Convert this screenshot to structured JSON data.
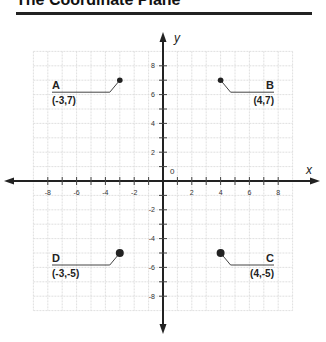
{
  "title": "The Coordinate Plane",
  "axes": {
    "x_label": "x",
    "y_label": "y",
    "origin_label": "0"
  },
  "chart_data": {
    "type": "scatter",
    "title": "The Coordinate Plane",
    "xlabel": "x",
    "ylabel": "y",
    "xlim": [
      -9,
      9
    ],
    "ylim": [
      -9,
      9
    ],
    "grid": true,
    "x_ticks": [
      "-8",
      "-6",
      "-4",
      "-2",
      "2",
      "4",
      "6",
      "8"
    ],
    "y_ticks": [
      "8",
      "6",
      "4",
      "2",
      "-2",
      "-4",
      "-6",
      "-8"
    ],
    "points": [
      {
        "name": "A",
        "label": "(-3,7)",
        "x": -3,
        "y": 7
      },
      {
        "name": "B",
        "label": "(4,7)",
        "x": 4,
        "y": 7
      },
      {
        "name": "C",
        "label": "(4,-5)",
        "x": 4,
        "y": -5
      },
      {
        "name": "D",
        "label": "(-3,-5)",
        "x": -3,
        "y": -5
      }
    ]
  }
}
